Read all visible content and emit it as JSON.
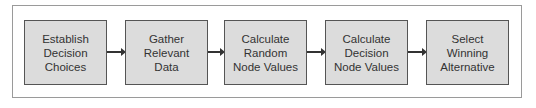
{
  "diagram": {
    "type": "flowchart",
    "direction": "left-to-right",
    "steps": [
      {
        "label": "Establish\nDecision\nChoices"
      },
      {
        "label": "Gather\nRelevant\nData"
      },
      {
        "label": "Calculate\nRandom\nNode Values"
      },
      {
        "label": "Calculate\nDecision\nNode Values"
      },
      {
        "label": "Select\nWinning\nAlternative"
      }
    ],
    "colors": {
      "box_fill": "#dcdcdc",
      "box_border": "#555555",
      "arrow": "#333333",
      "frame": "#9a9a9a"
    }
  }
}
